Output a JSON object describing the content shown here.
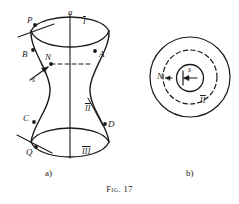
{
  "figure": {
    "caption_prefix": "Fig.",
    "caption_number": "17",
    "panels": [
      {
        "id": "a",
        "label": "a)"
      },
      {
        "id": "b",
        "label": "b)"
      }
    ]
  },
  "panel_a": {
    "axis_label": "a",
    "points": [
      {
        "name": "P",
        "label": "P"
      },
      {
        "name": "A",
        "label": "A"
      },
      {
        "name": "B",
        "label": "B"
      },
      {
        "name": "N",
        "label": "N"
      },
      {
        "name": "C",
        "label": "C"
      },
      {
        "name": "D",
        "label": "D"
      },
      {
        "name": "Q",
        "label": "Q"
      }
    ],
    "regions": [
      {
        "name": "region-one",
        "label": "I"
      },
      {
        "name": "region-two",
        "label": "II"
      },
      {
        "name": "region-three",
        "label": "III"
      }
    ],
    "vector_label": "s"
  },
  "panel_b": {
    "point_label": "N",
    "vector_label": "s",
    "region_label": "II"
  },
  "colors": {
    "stroke": "#1a1a1a",
    "background": "#ffffff"
  }
}
